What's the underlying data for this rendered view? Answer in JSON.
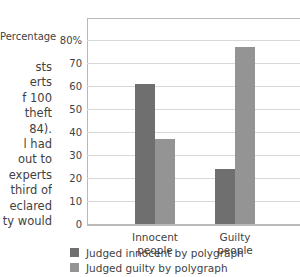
{
  "body_text": {
    "lines": [
      "sts",
      "erts",
      "f 100",
      " theft",
      "84).",
      "l had",
      "out to",
      "experts",
      "third of",
      "eclared",
      "ty would"
    ]
  },
  "chart_data": {
    "type": "bar",
    "title": "",
    "xlabel": "",
    "ylabel": "Percentage",
    "categories": [
      "Innocent people",
      "Guilty people"
    ],
    "category_lines": [
      [
        "Innocent",
        "people"
      ],
      [
        "Guilty",
        "people"
      ]
    ],
    "series": [
      {
        "name": "Judged innocent by polygraph",
        "color": "#6f6f6f",
        "values": [
          61,
          24
        ]
      },
      {
        "name": "Judged guilty by polygraph",
        "color": "#949494",
        "values": [
          37,
          77
        ]
      }
    ],
    "ylim": [
      0,
      80
    ],
    "yticks": [
      80,
      70,
      60,
      50,
      40,
      30,
      20,
      10,
      0
    ],
    "ytick_labels": [
      "80%",
      "70",
      "60",
      "50",
      "40",
      "30",
      "20",
      "10",
      "0"
    ],
    "grid": true,
    "legend_position": "bottom"
  }
}
